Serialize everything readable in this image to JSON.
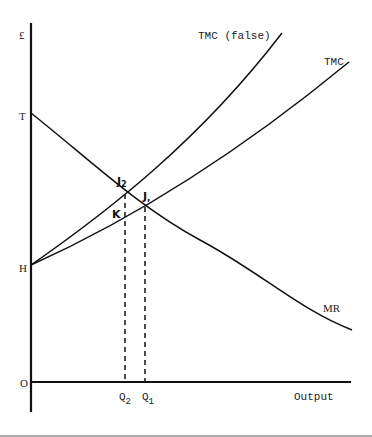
{
  "diagram": {
    "type": "economics-cost-revenue",
    "y_axis": {
      "top_label": "£",
      "origin_label": "O",
      "intercepts": [
        {
          "label": "T",
          "meaning": "MR intercept"
        },
        {
          "label": "H",
          "meaning": "TMC intercept"
        }
      ]
    },
    "x_axis": {
      "label": "Output",
      "ticks": [
        {
          "label": "Q",
          "sub": "2"
        },
        {
          "label": "Q",
          "sub": "1"
        }
      ]
    },
    "curves": [
      {
        "name": "TMC (false)",
        "label": "TMC (false)"
      },
      {
        "name": "TMC",
        "label": "TMC"
      },
      {
        "name": "MR",
        "label": "MR"
      }
    ],
    "points": [
      {
        "label": "J",
        "sub": "2",
        "meaning": "TMC (false) ∩ MR"
      },
      {
        "label": "J",
        "sub": "1",
        "meaning": "TMC ∩ MR"
      },
      {
        "label": "K",
        "meaning": "TMC at Q2"
      }
    ]
  },
  "labels": {
    "pound": "£",
    "T": "T",
    "H": "H",
    "O": "O",
    "output": "Output",
    "q2_main": "Q",
    "q2_sub": "2",
    "q1_main": "Q",
    "q1_sub": "1",
    "tmc_false": "TMC (false)",
    "tmc": "TMC",
    "mr": "MR",
    "j2_main": "J",
    "j2_sub": "2",
    "j1_main": "J",
    "j1_sub": ",",
    "k": "K"
  },
  "colors": {
    "ink": "#111111",
    "background": "#ffffff"
  }
}
